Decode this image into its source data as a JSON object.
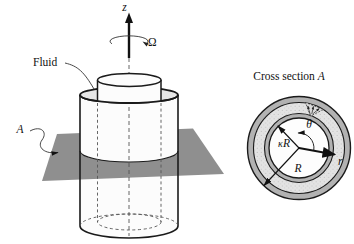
{
  "left_diagram": {
    "axis_label": "z",
    "rotation_label": "Ω",
    "fluid_label": "Fluid",
    "section_plane_label": "A",
    "colors": {
      "plane": "#8f8f8f",
      "fluid_surface": "#e7e7e7",
      "cylinder_fill": "#fcfcfc",
      "line": "#1a1a1a"
    }
  },
  "cross_section": {
    "title": "Cross section ",
    "title_suffix": "A",
    "inner_radius_label_kappa": "κ",
    "inner_radius_label_R": "R",
    "outer_radius_label": "R",
    "radial_axis_label": "r",
    "angle_label": "θ",
    "colors": {
      "wall": "#b2b2b2",
      "fluid": "#e3e3e3",
      "bore": "#fdfdfd",
      "outline": "#1a1a1a"
    }
  }
}
